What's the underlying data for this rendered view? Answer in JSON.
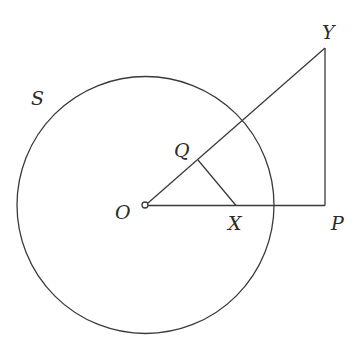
{
  "diagram": {
    "labels": {
      "circle": "S",
      "center": "O",
      "Q": "Q",
      "X": "X",
      "Y": "Y",
      "P": "P"
    },
    "colors": {
      "stroke": "#3a3a3a",
      "text": "#2a2a2a",
      "background": "#ffffff"
    }
  }
}
